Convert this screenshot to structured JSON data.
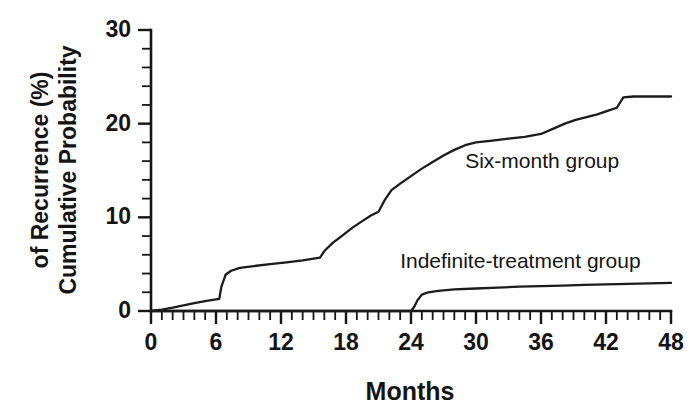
{
  "chart_data": {
    "type": "line",
    "title": "",
    "xlabel": "Months",
    "ylabel": "Cumulative Probability of Recurrence (%)",
    "xlim": [
      0,
      48
    ],
    "ylim": [
      0,
      30
    ],
    "x_major_ticks": [
      0,
      6,
      12,
      18,
      24,
      30,
      36,
      42,
      48
    ],
    "x_tick_labels": [
      "0",
      "6",
      "12",
      "18",
      "24",
      "30",
      "36",
      "42",
      "48"
    ],
    "x_minor_tick_interval": 1,
    "y_major_ticks": [
      0,
      10,
      20,
      30
    ],
    "y_tick_labels": [
      "0",
      "10",
      "20",
      "30"
    ],
    "y_minor_tick_interval": 2,
    "grid": false,
    "legend_position": "inline-annotations",
    "series": [
      {
        "name": "Six-month group",
        "label": "Six-month group",
        "label_x": 29.0,
        "label_y": 15.3,
        "points": [
          [
            0,
            0.0
          ],
          [
            1,
            0.15
          ],
          [
            2,
            0.35
          ],
          [
            3,
            0.6
          ],
          [
            4,
            0.85
          ],
          [
            5,
            1.05
          ],
          [
            6,
            1.25
          ],
          [
            6.3,
            1.3
          ],
          [
            6.5,
            2.6
          ],
          [
            6.9,
            3.9
          ],
          [
            7.4,
            4.3
          ],
          [
            8.2,
            4.6
          ],
          [
            9.5,
            4.8
          ],
          [
            11.0,
            5.0
          ],
          [
            12.5,
            5.2
          ],
          [
            14.0,
            5.4
          ],
          [
            15.6,
            5.7
          ],
          [
            16.0,
            6.4
          ],
          [
            16.8,
            7.3
          ],
          [
            17.6,
            8.0
          ],
          [
            18.6,
            8.9
          ],
          [
            19.5,
            9.6
          ],
          [
            20.3,
            10.2
          ],
          [
            21.0,
            10.6
          ],
          [
            21.6,
            11.9
          ],
          [
            22.2,
            12.9
          ],
          [
            23.0,
            13.6
          ],
          [
            24.0,
            14.4
          ],
          [
            25.0,
            15.2
          ],
          [
            26.0,
            15.9
          ],
          [
            27.0,
            16.6
          ],
          [
            28.0,
            17.2
          ],
          [
            29.0,
            17.7
          ],
          [
            30.0,
            18.0
          ],
          [
            31.5,
            18.2
          ],
          [
            33.0,
            18.4
          ],
          [
            34.5,
            18.6
          ],
          [
            36.0,
            18.9
          ],
          [
            37.2,
            19.5
          ],
          [
            38.2,
            20.0
          ],
          [
            39.2,
            20.4
          ],
          [
            40.2,
            20.7
          ],
          [
            41.2,
            21.0
          ],
          [
            42.2,
            21.4
          ],
          [
            43.0,
            21.7
          ],
          [
            43.6,
            22.8
          ],
          [
            44.5,
            22.9
          ],
          [
            46.0,
            22.9
          ],
          [
            48.0,
            22.9
          ]
        ]
      },
      {
        "name": "Indefinite-treatment group",
        "label": "Indefinite-treatment group",
        "label_x": 23.0,
        "label_y": 4.6,
        "points": [
          [
            0,
            0.0
          ],
          [
            6,
            0.0
          ],
          [
            12,
            0.0
          ],
          [
            18,
            0.0
          ],
          [
            23.0,
            0.0
          ],
          [
            24.0,
            0.0
          ],
          [
            24.3,
            0.45
          ],
          [
            24.6,
            1.15
          ],
          [
            25.0,
            1.75
          ],
          [
            25.6,
            2.0
          ],
          [
            26.5,
            2.15
          ],
          [
            28.0,
            2.3
          ],
          [
            30.0,
            2.4
          ],
          [
            32.0,
            2.5
          ],
          [
            34.0,
            2.6
          ],
          [
            36.0,
            2.65
          ],
          [
            38.0,
            2.7
          ],
          [
            40.0,
            2.78
          ],
          [
            42.0,
            2.85
          ],
          [
            44.0,
            2.9
          ],
          [
            46.0,
            2.95
          ],
          [
            48.0,
            3.0
          ]
        ]
      }
    ],
    "colors": {
      "line": "#1b1b1b",
      "axis": "#161616",
      "text": "#141414",
      "background": "#ffffff"
    }
  }
}
